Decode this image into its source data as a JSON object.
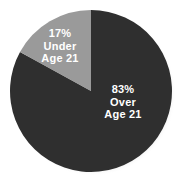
{
  "chart_data": {
    "type": "pie",
    "title": "",
    "categories": [
      "Under Age 21",
      "Over Age 21"
    ],
    "values": [
      17,
      83
    ],
    "unit": "%",
    "legend": "none",
    "slices": [
      {
        "name": "under-age-21",
        "percent_text": "17%",
        "value": 17,
        "label_line_1": "Under",
        "label_line_2": "Age 21",
        "color": "#9a9a9a",
        "label_color": "#ffffff",
        "start_angle_deg": 299,
        "end_angle_deg": 360
      },
      {
        "name": "over-age-21",
        "percent_text": "83%",
        "value": 83,
        "label_line_1": "Over",
        "label_line_2": "Age 21",
        "color": "#2f2f2f",
        "label_color": "#ffffff",
        "start_angle_deg": 0,
        "end_angle_deg": 299
      }
    ]
  },
  "colors": {
    "background": "#ffffff",
    "dark_slice": "#2f2f2f",
    "light_slice": "#9a9a9a",
    "label_text": "#ffffff",
    "shadow": "#b9b9b9"
  }
}
